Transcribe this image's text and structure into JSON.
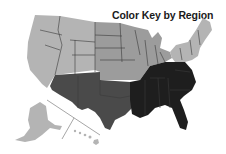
{
  "map": {
    "title": "Color Key by Region",
    "regions": [
      {
        "name": "West",
        "color": "#b4b4b4"
      },
      {
        "name": "Midwest",
        "color": "#9c9c9c"
      },
      {
        "name": "Northeast",
        "color": "#b4b4b4"
      },
      {
        "name": "Southwest",
        "color": "#4a4a4a"
      },
      {
        "name": "Southeast",
        "color": "#1e1e1e"
      }
    ],
    "insets": [
      "Alaska",
      "Hawaii"
    ]
  }
}
